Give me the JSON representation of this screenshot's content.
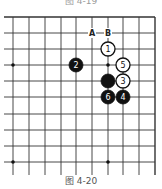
{
  "captions": {
    "top": "图 4-19",
    "bottom": "图 4-20"
  },
  "board": {
    "columns_x": [
      13,
      29,
      45,
      61,
      76,
      92,
      108,
      123,
      139,
      155
    ],
    "rows_y": [
      17,
      33,
      49,
      65,
      81,
      97,
      114,
      130,
      146,
      162
    ],
    "line_color": "#333333",
    "star_points": [
      {
        "col": 0,
        "row": 3
      },
      {
        "col": 6,
        "row": 3
      },
      {
        "col": 0,
        "row": 9
      },
      {
        "col": 6,
        "row": 9
      }
    ]
  },
  "labels": [
    {
      "text": "A",
      "col": 5,
      "row": 1
    },
    {
      "text": "B",
      "col": 6,
      "row": 1
    }
  ],
  "stones": [
    {
      "color": "white",
      "number": "1",
      "col": 6,
      "row": 2
    },
    {
      "color": "black",
      "number": "2",
      "col": 4,
      "row": 3
    },
    {
      "color": "white",
      "number": "5",
      "col": 7,
      "row": 3
    },
    {
      "color": "black",
      "number": "",
      "col": 6,
      "row": 4
    },
    {
      "color": "white",
      "number": "3",
      "col": 7,
      "row": 4
    },
    {
      "color": "black",
      "number": "6",
      "col": 6,
      "row": 5
    },
    {
      "color": "black",
      "number": "4",
      "col": 7,
      "row": 5
    }
  ]
}
